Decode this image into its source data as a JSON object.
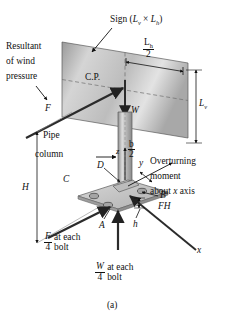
{
  "figure": {
    "caption": "(a)",
    "title_sign": "Sign (",
    "labels": {
      "sign_prefix": "Sign (",
      "sign_Lv": "L",
      "sign_Lv_sub": "v",
      "sign_times": " × ",
      "sign_Lh": "L",
      "sign_Lh_sub": "h",
      "sign_suffix": ")",
      "resultant_line1": "Resultant",
      "resultant_line2": "of wind",
      "resultant_line3": "pressure",
      "force_F": "F",
      "cp": "C.P.",
      "weight_W": "W",
      "Lh_num": "L",
      "Lh_num_sub": "h",
      "Lh_den": "2",
      "Lv": "L",
      "Lv_sub": "v",
      "pipe_line1": "Pipe",
      "pipe_line2": "column",
      "H": "H",
      "axis_z": "z",
      "axis_y": "y",
      "axis_x": "x",
      "b_num": "b",
      "b_den": "2",
      "point_A": "A",
      "point_B": "B",
      "point_C": "C",
      "point_D": "D",
      "h": "h",
      "overturn_line1": "Overturning",
      "overturn_line2": "moment",
      "overturn_line3_a": "about ",
      "overturn_line3_x": "x",
      "overturn_line3_b": " axis",
      "overturn_FH": "FH",
      "F4_num": "F",
      "F4_den": "4",
      "F4_text1": "at each",
      "F4_text2": "bolt",
      "W4_num": "W",
      "W4_den": "4",
      "W4_text1": "at each",
      "W4_text2": "bolt"
    },
    "colors": {
      "ink": "#111111",
      "sign_light": "#e2e2e2",
      "sign_mid": "#b9b9b9",
      "sign_dark": "#8f8f8f",
      "plate_fill": "#c9c9c9",
      "column_light": "#d8d8d8",
      "column_dark": "#9a9a9a",
      "dashed": "#777777"
    }
  }
}
